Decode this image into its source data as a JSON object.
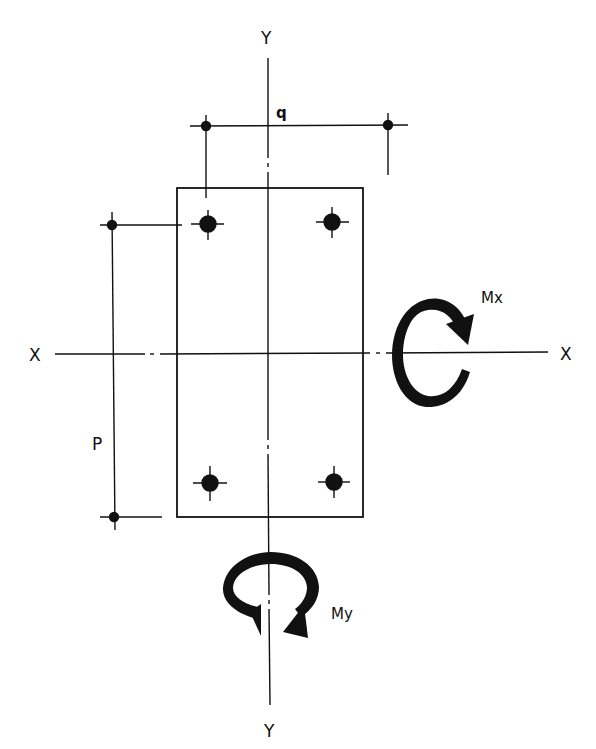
{
  "diagram": {
    "axes": {
      "y_top_label": "Y",
      "y_bottom_label": "Y",
      "x_left_label": "X",
      "x_right_label": "X"
    },
    "dimensions": {
      "horizontal_bolt_spacing_label": "q",
      "vertical_bolt_spacing_label": "P"
    },
    "moments": {
      "about_x_label": "Mx",
      "about_y_label": "My"
    },
    "bolts": [
      {
        "id": "top-left"
      },
      {
        "id": "top-right"
      },
      {
        "id": "bottom-left"
      },
      {
        "id": "bottom-right"
      }
    ],
    "colors": {
      "ink": "#111111",
      "background": "#ffffff"
    }
  }
}
